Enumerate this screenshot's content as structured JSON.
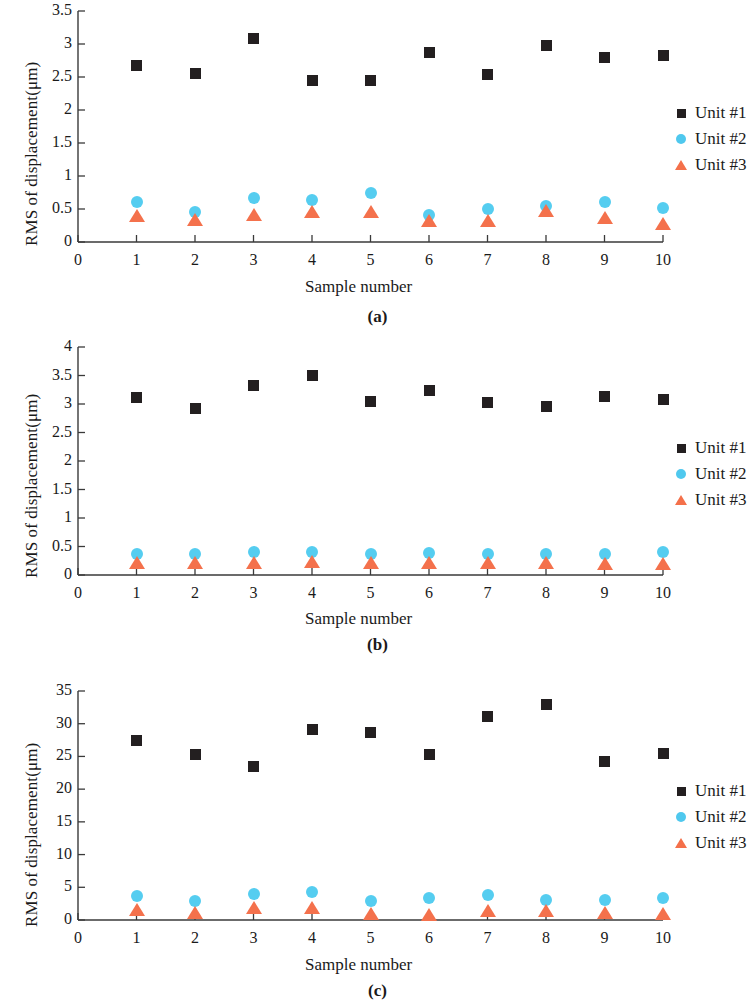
{
  "figure": {
    "panels": [
      {
        "id": "a",
        "caption": "(a)",
        "xlabel": "Sample number",
        "ylabel": "RMS of displacement(μm)",
        "ytick_labels": [
          "0",
          "0.5",
          "1",
          "1.5",
          "2",
          "2.5",
          "3",
          "3.5"
        ],
        "xtick_labels": [
          "0",
          "1",
          "2",
          "3",
          "4",
          "5",
          "6",
          "7",
          "8",
          "9",
          "10"
        ],
        "legend": [
          {
            "label": "Unit #1",
            "marker": "square",
            "color": "#231f20"
          },
          {
            "label": "Unit #2",
            "marker": "circle",
            "color": "#4fc8ee"
          },
          {
            "label": "Unit #3",
            "marker": "triangle",
            "color": "#f4704a"
          }
        ]
      },
      {
        "id": "b",
        "caption": "(b)",
        "xlabel": "Sample number",
        "ylabel": "RMS of displacement(μm)",
        "ytick_labels": [
          "0",
          "0.5",
          "1",
          "1.5",
          "2",
          "2.5",
          "3",
          "3.5",
          "4"
        ],
        "xtick_labels": [
          "0",
          "1",
          "2",
          "3",
          "4",
          "5",
          "6",
          "7",
          "8",
          "9",
          "10"
        ],
        "legend": [
          {
            "label": "Unit #1",
            "marker": "square",
            "color": "#231f20"
          },
          {
            "label": "Unit #2",
            "marker": "circle",
            "color": "#4fc8ee"
          },
          {
            "label": "Unit #3",
            "marker": "triangle",
            "color": "#f4704a"
          }
        ]
      },
      {
        "id": "c",
        "caption": "(c)",
        "xlabel": "Sample number",
        "ylabel": "RMS of displacement(μm)",
        "ytick_labels": [
          "0",
          "5",
          "10",
          "15",
          "20",
          "25",
          "30",
          "35"
        ],
        "xtick_labels": [
          "0",
          "1",
          "2",
          "3",
          "4",
          "5",
          "6",
          "7",
          "8",
          "9",
          "10"
        ],
        "legend": [
          {
            "label": "Unit #1",
            "marker": "square",
            "color": "#231f20"
          },
          {
            "label": "Unit #2",
            "marker": "circle",
            "color": "#4fc8ee"
          },
          {
            "label": "Unit #3",
            "marker": "triangle",
            "color": "#f4704a"
          }
        ]
      }
    ]
  },
  "chart_data": [
    {
      "type": "scatter",
      "panel": "a",
      "title": "",
      "xlabel": "Sample number",
      "ylabel": "RMS of displacement(μm)",
      "x": [
        1,
        2,
        3,
        4,
        5,
        6,
        7,
        8,
        9,
        10
      ],
      "xlim": [
        0,
        10
      ],
      "ylim": [
        0,
        3.5
      ],
      "yticks": [
        0,
        0.5,
        1,
        1.5,
        2,
        2.5,
        3,
        3.5
      ],
      "xticks": [
        0,
        1,
        2,
        3,
        4,
        5,
        6,
        7,
        8,
        9,
        10
      ],
      "grid": false,
      "legend_position": "right",
      "series": [
        {
          "name": "Unit #1",
          "marker": "square",
          "color": "#231f20",
          "values": [
            2.68,
            2.55,
            3.08,
            2.45,
            2.45,
            2.87,
            2.54,
            2.98,
            2.79,
            2.82
          ]
        },
        {
          "name": "Unit #2",
          "marker": "circle",
          "color": "#4fc8ee",
          "values": [
            0.6,
            0.45,
            0.66,
            0.64,
            0.74,
            0.41,
            0.5,
            0.55,
            0.61,
            0.52
          ]
        },
        {
          "name": "Unit #3",
          "marker": "triangle",
          "color": "#f4704a",
          "values": [
            0.37,
            0.31,
            0.38,
            0.43,
            0.43,
            0.29,
            0.29,
            0.44,
            0.33,
            0.25
          ]
        }
      ]
    },
    {
      "type": "scatter",
      "panel": "b",
      "title": "",
      "xlabel": "Sample number",
      "ylabel": "RMS of displacement(μm)",
      "x": [
        1,
        2,
        3,
        4,
        5,
        6,
        7,
        8,
        9,
        10
      ],
      "xlim": [
        0,
        10
      ],
      "ylim": [
        0,
        4
      ],
      "yticks": [
        0,
        0.5,
        1,
        1.5,
        2,
        2.5,
        3,
        3.5,
        4
      ],
      "xticks": [
        0,
        1,
        2,
        3,
        4,
        5,
        6,
        7,
        8,
        9,
        10
      ],
      "grid": false,
      "legend_position": "right",
      "series": [
        {
          "name": "Unit #1",
          "marker": "square",
          "color": "#231f20",
          "values": [
            3.12,
            2.92,
            3.33,
            3.5,
            3.04,
            3.24,
            3.02,
            2.96,
            3.14,
            3.08
          ]
        },
        {
          "name": "Unit #2",
          "marker": "circle",
          "color": "#4fc8ee",
          "values": [
            0.36,
            0.37,
            0.4,
            0.41,
            0.37,
            0.38,
            0.37,
            0.37,
            0.36,
            0.4
          ]
        },
        {
          "name": "Unit #3",
          "marker": "triangle",
          "color": "#f4704a",
          "values": [
            0.17,
            0.17,
            0.18,
            0.2,
            0.17,
            0.18,
            0.17,
            0.17,
            0.16,
            0.15
          ]
        }
      ]
    },
    {
      "type": "scatter",
      "panel": "c",
      "title": "",
      "xlabel": "Sample number",
      "ylabel": "RMS of displacement(μm)",
      "x": [
        1,
        2,
        3,
        4,
        5,
        6,
        7,
        8,
        9,
        10
      ],
      "xlim": [
        0,
        10
      ],
      "ylim": [
        0,
        35
      ],
      "yticks": [
        0,
        5,
        10,
        15,
        20,
        25,
        30,
        35
      ],
      "xticks": [
        0,
        1,
        2,
        3,
        4,
        5,
        6,
        7,
        8,
        9,
        10
      ],
      "grid": false,
      "legend_position": "right",
      "series": [
        {
          "name": "Unit #1",
          "marker": "square",
          "color": "#231f20",
          "values": [
            27.4,
            25.3,
            23.5,
            29.1,
            28.7,
            25.3,
            31.1,
            32.9,
            24.2,
            25.4
          ]
        },
        {
          "name": "Unit #2",
          "marker": "circle",
          "color": "#4fc8ee",
          "values": [
            3.6,
            2.9,
            3.9,
            4.3,
            2.9,
            3.4,
            3.8,
            3.0,
            3.1,
            3.3
          ]
        },
        {
          "name": "Unit #3",
          "marker": "triangle",
          "color": "#f4704a",
          "values": [
            1.2,
            0.8,
            1.5,
            1.5,
            0.6,
            0.5,
            1.0,
            1.0,
            0.7,
            0.6
          ]
        }
      ]
    }
  ]
}
